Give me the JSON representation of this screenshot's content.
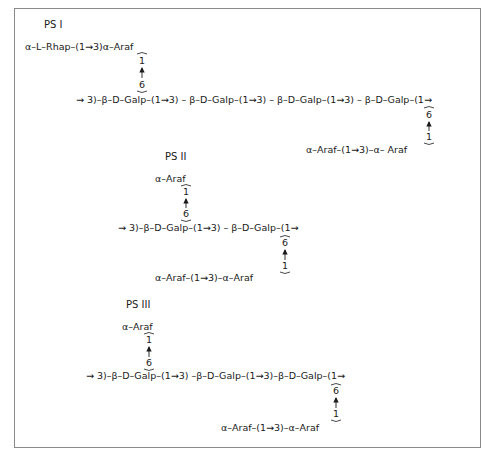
{
  "structures": [
    {
      "id": "ps1",
      "title": "PS I",
      "main_chain": "→ 3)–β–D–Galp–(1→3) – β–D–Galp–(1→3) – β–D–Galp–(1→3) – β–D–Galp–(1→",
      "upper_branch": {
        "text": "α–L–Rhap–(1→3)α–Araf",
        "from_position": "1",
        "to_position": "6"
      },
      "lower_branch": {
        "text": "α–Araf–(1→3)–α– Araf",
        "from_position": "1",
        "to_position": "6"
      }
    },
    {
      "id": "ps2",
      "title": "PS II",
      "main_chain": "→ 3)–β–D–Galp–(1→3) – β–D–Galp–(1→",
      "upper_branch": {
        "text": "α–Araf",
        "from_position": "1",
        "to_position": "6"
      },
      "lower_branch": {
        "text": "α–Araf–(1→3)–α–Araf",
        "from_position": "1",
        "to_position": "6"
      }
    },
    {
      "id": "ps3",
      "title": "PS III",
      "main_chain": "→ 3)–β–D–Galp–(1→3) –β–D–Galp–(1→3)–β–D–Galp–(1→",
      "upper_branch": {
        "text": "α–Araf",
        "from_position": "1",
        "to_position": "6"
      },
      "lower_branch": {
        "text": "α–Araf–(1→3)–α–Araf",
        "from_position": "1",
        "to_position": "6"
      }
    }
  ]
}
